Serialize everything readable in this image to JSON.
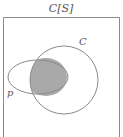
{
  "diagram": {
    "title": "C[S]",
    "labels": {
      "circle": "C",
      "ellipse": "p"
    },
    "colors": {
      "stroke": "#8a8a8a",
      "shade": "#a9a9a9",
      "text": "#555555",
      "background": "#ffffff"
    }
  }
}
